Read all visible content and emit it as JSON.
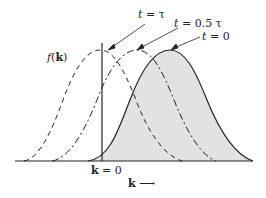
{
  "figure": {
    "y_axis_label_func": "f",
    "y_axis_label_open": "(",
    "y_axis_label_var": "k",
    "y_axis_label_close": ")",
    "origin_label_var": "k",
    "origin_label_rest": " = 0",
    "x_axis_label_var": "k",
    "x_axis_arrow": "⟶"
  },
  "curves": [
    {
      "label_var": "t",
      "label_rest": " = τ",
      "style": "dashed",
      "peak_x": 100
    },
    {
      "label_var": "t",
      "label_rest": " = 0.5 τ",
      "style": "dash-dot",
      "peak_x": 137
    },
    {
      "label_var": "t",
      "label_rest": " = 0",
      "style": "solid-filled",
      "peak_x": 170
    }
  ],
  "colors": {
    "fill": "#e2e2e2",
    "stroke": "#222222"
  }
}
